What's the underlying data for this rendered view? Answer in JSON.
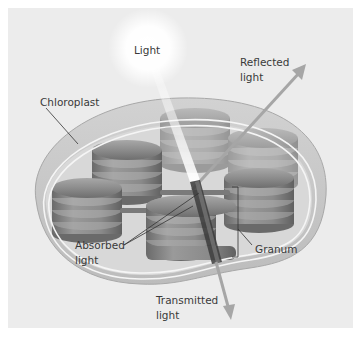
{
  "figure": {
    "type": "chloroplast light interaction diagram",
    "colors": {
      "background": "#ececec",
      "chloroplast_outer": "#c8c8c8",
      "stroma": "#d9d9d9",
      "granum": "#8a8a8a",
      "arrow": "#a6a6a6",
      "absorbed_beam": "#3c3c3c",
      "text": "#3a3a3a"
    }
  },
  "labels": {
    "light": "Light",
    "reflected": {
      "line1": "Reflected",
      "line2": "light"
    },
    "chloroplast": "Chloroplast",
    "absorbed": {
      "line1": "Absorbed",
      "line2": "light"
    },
    "granum": "Granum",
    "transmitted": {
      "line1": "Transmitted",
      "line2": "light"
    }
  }
}
